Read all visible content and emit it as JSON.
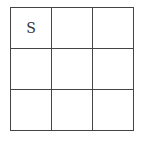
{
  "grid": {
    "rows": 3,
    "cols": 3,
    "cells": [
      [
        "S",
        "",
        ""
      ],
      [
        "",
        "",
        ""
      ],
      [
        "",
        "",
        ""
      ]
    ]
  }
}
